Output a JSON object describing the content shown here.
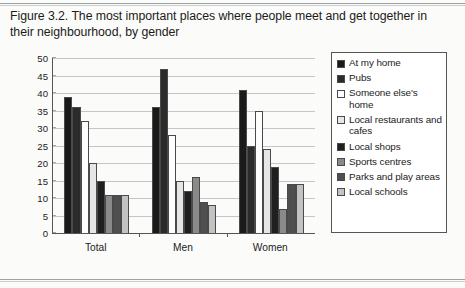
{
  "caption": "Figure 3.2. The most important places where people meet and get together in their neighbourhood, by gender",
  "chart_data": {
    "type": "bar",
    "title": "Figure 3.2. The most important places where people meet and get together in their neighbourhood, by gender",
    "xlabel": "",
    "ylabel": "",
    "ylim": [
      0,
      50
    ],
    "yticks": [
      50,
      45,
      40,
      35,
      30,
      25,
      20,
      15,
      10,
      5,
      0
    ],
    "grid": true,
    "legend_position": "right",
    "categories": [
      "Total",
      "Men",
      "Women"
    ],
    "series": [
      {
        "name": "At my home",
        "color": "#1a1a1a",
        "values": [
          39,
          36,
          41
        ]
      },
      {
        "name": "Pubs",
        "color": "#2b2b2b",
        "values": [
          36,
          47,
          25
        ]
      },
      {
        "name": "Someone else's home",
        "color": "#fdfdfd",
        "values": [
          32,
          28,
          35
        ]
      },
      {
        "name": "Local restaurants and cafes",
        "color": "#e6e6e6",
        "values": [
          20,
          15,
          24
        ]
      },
      {
        "name": "Local shops",
        "color": "#1f1f1f",
        "values": [
          15,
          12,
          19
        ]
      },
      {
        "name": "Sports centres",
        "color": "#8a8a8a",
        "values": [
          11,
          16,
          7
        ]
      },
      {
        "name": "Parks and play areas",
        "color": "#4f4f4f",
        "values": [
          11,
          9,
          14
        ]
      },
      {
        "name": "Local schools",
        "color": "#c2c2c2",
        "values": [
          11,
          8,
          14
        ]
      }
    ]
  },
  "legend": {
    "items": [
      {
        "label": "At my home"
      },
      {
        "label": "Pubs"
      },
      {
        "label": "Someone else's home"
      },
      {
        "label": "Local restaurants and cafes"
      },
      {
        "label": "Local shops"
      },
      {
        "label": "Sports centres"
      },
      {
        "label": "Parks and play areas"
      },
      {
        "label": "Local schools"
      }
    ]
  }
}
